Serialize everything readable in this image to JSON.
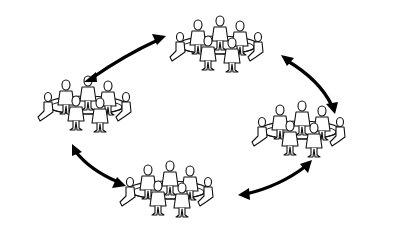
{
  "diagram": {
    "type": "cycle",
    "nodes": [
      {
        "id": "group-top",
        "cx": 218,
        "cy": 45
      },
      {
        "id": "group-right",
        "cx": 300,
        "cy": 132
      },
      {
        "id": "group-bottom",
        "cx": 170,
        "cy": 195
      },
      {
        "id": "group-left",
        "cx": 85,
        "cy": 108
      }
    ],
    "edges": [
      {
        "from": "group-left",
        "to": "group-top",
        "bidirectional": true
      },
      {
        "from": "group-top",
        "to": "group-right",
        "bidirectional": true
      },
      {
        "from": "group-right",
        "to": "group-bottom",
        "bidirectional": true
      },
      {
        "from": "group-bottom",
        "to": "group-left",
        "bidirectional": true
      }
    ],
    "colors": {
      "line": "#000000",
      "fill": "#ffffff",
      "background": "#ffffff"
    }
  }
}
